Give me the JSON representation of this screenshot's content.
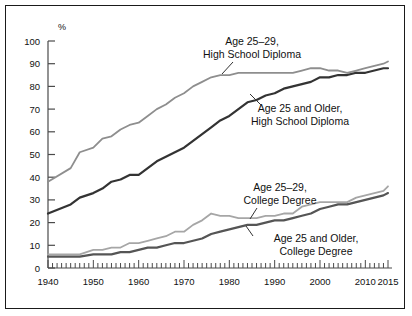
{
  "chart_data": {
    "type": "line",
    "title": "",
    "xlabel": "",
    "ylabel": "%",
    "ylim": [
      0,
      100
    ],
    "xlim": [
      1940,
      2015
    ],
    "ytick_labels": [
      "0",
      "10",
      "20",
      "30",
      "40",
      "50",
      "60",
      "70",
      "80",
      "90",
      "100"
    ],
    "yticks": [
      0,
      10,
      20,
      30,
      40,
      50,
      60,
      70,
      80,
      90,
      100
    ],
    "xtick_labels": [
      "1940",
      "1950",
      "1960",
      "1970",
      "1980",
      "1990",
      "2000",
      "2010",
      "2015"
    ],
    "xticks": [
      1940,
      1950,
      1960,
      1970,
      1980,
      1990,
      2000,
      2010,
      2015
    ],
    "grid": false,
    "legend": "inline-annotations",
    "minor_xticks_every": 1,
    "series": [
      {
        "name": "Age 25–29, High School Diploma",
        "color": "#8e8e8e",
        "x": [
          1940,
          1945,
          1947,
          1950,
          1952,
          1954,
          1956,
          1958,
          1960,
          1962,
          1964,
          1966,
          1968,
          1970,
          1972,
          1974,
          1976,
          1978,
          1980,
          1982,
          1984,
          1986,
          1988,
          1990,
          1992,
          1994,
          1996,
          1998,
          2000,
          2002,
          2004,
          2006,
          2008,
          2010,
          2012,
          2014,
          2015
        ],
        "values": [
          38,
          44,
          51,
          53,
          57,
          58,
          61,
          63,
          64,
          67,
          70,
          72,
          75,
          77,
          80,
          82,
          84,
          85,
          85,
          86,
          86,
          86,
          86,
          86,
          86,
          86,
          87,
          88,
          88,
          87,
          87,
          86,
          87,
          88,
          89,
          90,
          91
        ]
      },
      {
        "name": "Age 25 and Older, High School Diploma",
        "color": "#333333",
        "x": [
          1940,
          1945,
          1947,
          1950,
          1952,
          1954,
          1956,
          1958,
          1960,
          1962,
          1964,
          1966,
          1968,
          1970,
          1972,
          1974,
          1976,
          1978,
          1980,
          1982,
          1984,
          1986,
          1988,
          1990,
          1992,
          1994,
          1996,
          1998,
          2000,
          2002,
          2004,
          2006,
          2008,
          2010,
          2012,
          2014,
          2015
        ],
        "values": [
          24,
          28,
          31,
          33,
          35,
          38,
          39,
          41,
          41,
          44,
          47,
          49,
          51,
          53,
          56,
          59,
          62,
          65,
          67,
          70,
          73,
          74,
          76,
          77,
          79,
          80,
          81,
          82,
          84,
          84,
          85,
          85,
          86,
          86,
          87,
          88,
          88
        ]
      },
      {
        "name": "Age 25–29, College Degree",
        "color": "#a6a6a6",
        "x": [
          1940,
          1945,
          1947,
          1950,
          1952,
          1954,
          1956,
          1958,
          1960,
          1962,
          1964,
          1966,
          1968,
          1970,
          1972,
          1974,
          1976,
          1978,
          1980,
          1982,
          1984,
          1986,
          1988,
          1990,
          1992,
          1994,
          1996,
          1998,
          2000,
          2002,
          2004,
          2006,
          2008,
          2010,
          2012,
          2014,
          2015
        ],
        "values": [
          6,
          6,
          6,
          8,
          8,
          9,
          9,
          11,
          11,
          12,
          13,
          14,
          16,
          16,
          19,
          21,
          24,
          23,
          23,
          22,
          22,
          22,
          23,
          23,
          24,
          24,
          27,
          28,
          29,
          29,
          29,
          29,
          31,
          32,
          33,
          34,
          36
        ]
      },
      {
        "name": "Age 25 and Older, College Degree",
        "color": "#555555",
        "x": [
          1940,
          1945,
          1947,
          1950,
          1952,
          1954,
          1956,
          1958,
          1960,
          1962,
          1964,
          1966,
          1968,
          1970,
          1972,
          1974,
          1976,
          1978,
          1980,
          1982,
          1984,
          1986,
          1988,
          1990,
          1992,
          1994,
          1996,
          1998,
          2000,
          2002,
          2004,
          2006,
          2008,
          2010,
          2012,
          2014,
          2015
        ],
        "values": [
          5,
          5,
          5,
          6,
          6,
          6,
          7,
          7,
          8,
          9,
          9,
          10,
          11,
          11,
          12,
          13,
          15,
          16,
          17,
          18,
          19,
          19,
          20,
          21,
          21,
          22,
          23,
          24,
          26,
          27,
          28,
          28,
          29,
          30,
          31,
          32,
          33
        ]
      }
    ],
    "annotations": [
      {
        "name": "age-25-29-high-school-diploma",
        "line1": "Age 25–29,",
        "line2": "High School Diploma"
      },
      {
        "name": "age-25-and-older-high-school-diploma",
        "line1": "Age 25 and Older,",
        "line2": "High School Diploma"
      },
      {
        "name": "age-25-29-college-degree",
        "line1": "Age 25–29,",
        "line2": "College Degree"
      },
      {
        "name": "age-25-and-older-college-degree",
        "line1": "Age 25 and Older,",
        "line2": "College Degree"
      }
    ]
  }
}
